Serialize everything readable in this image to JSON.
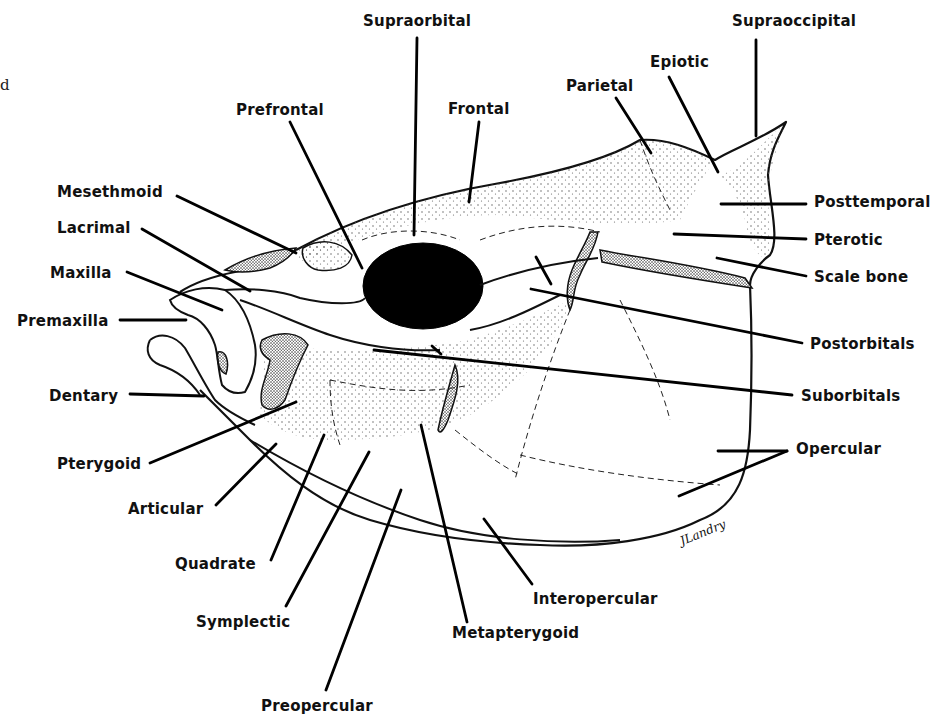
{
  "figure": {
    "stray_glyph": "d",
    "signature": "JLandry",
    "colors": {
      "ink": "#111111",
      "background": "#ffffff",
      "stipple": "#555555"
    }
  },
  "labels": [
    {
      "id": "supraorbital",
      "text": "Supraorbital",
      "x": 363,
      "y": 12
    },
    {
      "id": "supraoccipital",
      "text": "Supraoccipital",
      "x": 732,
      "y": 12
    },
    {
      "id": "epiotic",
      "text": "Epiotic",
      "x": 650,
      "y": 53
    },
    {
      "id": "parietal",
      "text": "Parietal",
      "x": 566,
      "y": 77
    },
    {
      "id": "prefrontal",
      "text": "Prefrontal",
      "x": 236,
      "y": 101
    },
    {
      "id": "frontal",
      "text": "Frontal",
      "x": 448,
      "y": 100
    },
    {
      "id": "mesethmoid",
      "text": "Mesethmoid",
      "x": 57,
      "y": 183
    },
    {
      "id": "posttemporal",
      "text": "Posttemporal",
      "x": 814,
      "y": 193
    },
    {
      "id": "lacrimal",
      "text": "Lacrimal",
      "x": 57,
      "y": 219
    },
    {
      "id": "pterotic",
      "text": "Pterotic",
      "x": 814,
      "y": 231
    },
    {
      "id": "maxilla",
      "text": "Maxilla",
      "x": 50,
      "y": 264
    },
    {
      "id": "scale-bone",
      "text": "Scale bone",
      "x": 814,
      "y": 268
    },
    {
      "id": "premaxilla",
      "text": "Premaxilla",
      "x": 17,
      "y": 312
    },
    {
      "id": "postorbitals",
      "text": "Postorbitals",
      "x": 810,
      "y": 335
    },
    {
      "id": "dentary",
      "text": "Dentary",
      "x": 49,
      "y": 387
    },
    {
      "id": "suborbitals",
      "text": "Suborbitals",
      "x": 801,
      "y": 387
    },
    {
      "id": "opercular",
      "text": "Opercular",
      "x": 796,
      "y": 440
    },
    {
      "id": "pterygoid",
      "text": "Pterygoid",
      "x": 57,
      "y": 455
    },
    {
      "id": "articular",
      "text": "Articular",
      "x": 128,
      "y": 500
    },
    {
      "id": "quadrate",
      "text": "Quadrate",
      "x": 175,
      "y": 555
    },
    {
      "id": "interopercular",
      "text": "Interopercular",
      "x": 533,
      "y": 590
    },
    {
      "id": "symplectic",
      "text": "Symplectic",
      "x": 196,
      "y": 613
    },
    {
      "id": "metapterygoid",
      "text": "Metapterygoid",
      "x": 452,
      "y": 624
    },
    {
      "id": "preopercular",
      "text": "Preopercular",
      "x": 261,
      "y": 697
    }
  ],
  "leader_lines": [
    {
      "label": "supraorbital",
      "x1": 417,
      "y1": 38,
      "x2": 414,
      "y2": 235
    },
    {
      "label": "supraoccipital",
      "x1": 756,
      "y1": 40,
      "x2": 756,
      "y2": 136
    },
    {
      "label": "epiotic",
      "x1": 669,
      "y1": 77,
      "x2": 718,
      "y2": 172
    },
    {
      "label": "parietal",
      "x1": 616,
      "y1": 98,
      "x2": 651,
      "y2": 153
    },
    {
      "label": "prefrontal",
      "x1": 290,
      "y1": 122,
      "x2": 362,
      "y2": 268
    },
    {
      "label": "frontal",
      "x1": 479,
      "y1": 122,
      "x2": 469,
      "y2": 202
    },
    {
      "label": "mesethmoid",
      "x1": 177,
      "y1": 196,
      "x2": 296,
      "y2": 253
    },
    {
      "label": "posttemporal",
      "x1": 721,
      "y1": 204,
      "x2": 806,
      "y2": 204
    },
    {
      "label": "lacrimal",
      "x1": 142,
      "y1": 229,
      "x2": 250,
      "y2": 291
    },
    {
      "label": "pterotic",
      "x1": 674,
      "y1": 234,
      "x2": 806,
      "y2": 239
    },
    {
      "label": "maxilla",
      "x1": 127,
      "y1": 272,
      "x2": 222,
      "y2": 310
    },
    {
      "label": "scale-bone",
      "x1": 717,
      "y1": 258,
      "x2": 806,
      "y2": 276
    },
    {
      "label": "premaxilla",
      "x1": 120,
      "y1": 320,
      "x2": 186,
      "y2": 320
    },
    {
      "label": "postorbitals",
      "x1": 531,
      "y1": 289,
      "x2": 802,
      "y2": 343
    },
    {
      "label": "postorbitals-2",
      "x1": 536,
      "y1": 257,
      "x2": 551,
      "y2": 284
    },
    {
      "label": "dentary",
      "x1": 130,
      "y1": 394,
      "x2": 204,
      "y2": 396
    },
    {
      "label": "suborbitals",
      "x1": 374,
      "y1": 350,
      "x2": 792,
      "y2": 395
    },
    {
      "label": "suborbitals-2",
      "x1": 432,
      "y1": 346,
      "x2": 441,
      "y2": 354
    },
    {
      "label": "opercular-a",
      "x1": 718,
      "y1": 451,
      "x2": 787,
      "y2": 451
    },
    {
      "label": "opercular-b",
      "x1": 679,
      "y1": 496,
      "x2": 787,
      "y2": 451
    },
    {
      "label": "pterygoid",
      "x1": 150,
      "y1": 463,
      "x2": 296,
      "y2": 402
    },
    {
      "label": "articular",
      "x1": 216,
      "y1": 505,
      "x2": 276,
      "y2": 444
    },
    {
      "label": "quadrate",
      "x1": 271,
      "y1": 560,
      "x2": 324,
      "y2": 435
    },
    {
      "label": "interopercular",
      "x1": 484,
      "y1": 519,
      "x2": 532,
      "y2": 584
    },
    {
      "label": "symplectic",
      "x1": 286,
      "y1": 606,
      "x2": 369,
      "y2": 452
    },
    {
      "label": "metapterygoid",
      "x1": 421,
      "y1": 425,
      "x2": 467,
      "y2": 622
    },
    {
      "label": "preopercular",
      "x1": 326,
      "y1": 690,
      "x2": 401,
      "y2": 490
    }
  ]
}
